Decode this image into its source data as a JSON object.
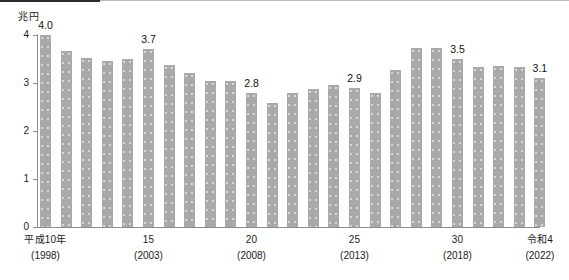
{
  "chart_data": {
    "type": "bar",
    "title": "",
    "subtitle": "",
    "xlabel": "",
    "ylabel": "兆円",
    "ylim": [
      0,
      4
    ],
    "ytick_labels": [
      "0",
      "1",
      "2",
      "3",
      "4"
    ],
    "ytick_values": [
      0,
      1,
      2,
      3,
      4
    ],
    "grid": false,
    "legend": null,
    "bar_color": "#a9a9a9",
    "axis_color": "#8d8d8d",
    "categories": [
      "1998",
      "1999",
      "2000",
      "2001",
      "2002",
      "2003",
      "2004",
      "2005",
      "2006",
      "2007",
      "2008",
      "2009",
      "2010",
      "2011",
      "2012",
      "2013",
      "2014",
      "2015",
      "2016",
      "2017",
      "2018",
      "2019",
      "2020",
      "2021",
      "2022"
    ],
    "values": [
      4.0,
      3.67,
      3.52,
      3.46,
      3.49,
      3.7,
      3.37,
      3.2,
      3.05,
      3.04,
      2.8,
      2.58,
      2.79,
      2.88,
      2.95,
      2.9,
      2.8,
      3.27,
      3.72,
      3.72,
      3.5,
      3.34,
      3.36,
      3.34,
      3.1
    ],
    "data_labels": [
      {
        "index": 0,
        "text": "4.0"
      },
      {
        "index": 5,
        "text": "3.7"
      },
      {
        "index": 10,
        "text": "2.8"
      },
      {
        "index": 15,
        "text": "2.9"
      },
      {
        "index": 20,
        "text": "3.5"
      },
      {
        "index": 24,
        "text": "3.1"
      }
    ],
    "x_axis_ticks": [
      {
        "index": 0,
        "era": "平成10年",
        "year": "(1998)"
      },
      {
        "index": 5,
        "era": "15",
        "year": "(2003)"
      },
      {
        "index": 10,
        "era": "20",
        "year": "(2008)"
      },
      {
        "index": 15,
        "era": "25",
        "year": "(2013)"
      },
      {
        "index": 20,
        "era": "30",
        "year": "(2018)"
      },
      {
        "index": 24,
        "era": "令和4",
        "year": "(2022)"
      }
    ]
  },
  "axis": {
    "unit_caption": "兆円"
  }
}
